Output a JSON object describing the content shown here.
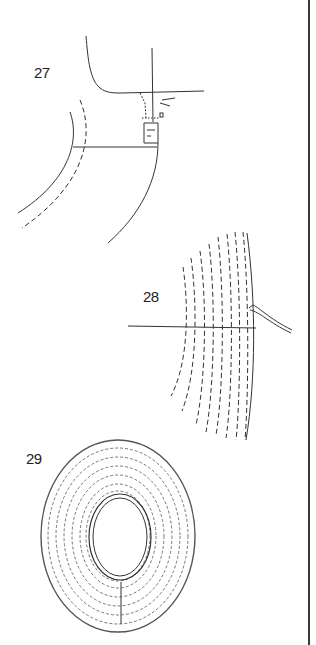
{
  "page": {
    "background": "#ffffff",
    "line_color": "#333333"
  },
  "figures": [
    {
      "number": "27",
      "description": "sewing-machine-presser-foot-stitching-curved-edge"
    },
    {
      "number": "28",
      "description": "concentric-dashed-stitch-rows-with-thread"
    },
    {
      "number": "29",
      "description": "oval-ring-with-concentric-stitching"
    }
  ]
}
